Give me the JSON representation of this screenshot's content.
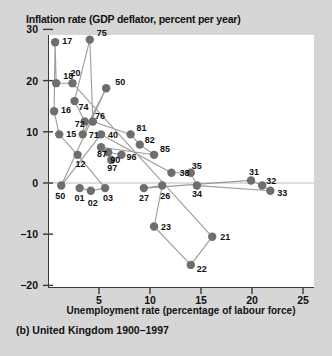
{
  "chart_data": {
    "type": "scatter",
    "title": "Inflation rate (GDP deflator, percent per year)",
    "caption": "(b) United Kingdom 1900–1997",
    "xlabel": "Unemployment rate (percentage of labour force)",
    "ylabel": "Inflation rate (GDP deflator, percent per year)",
    "xlim": [
      0,
      26
    ],
    "ylim": [
      -20,
      32
    ],
    "xticks": [
      5,
      10,
      15,
      20,
      25
    ],
    "yticks": [
      30,
      20,
      10,
      0,
      -10,
      -20
    ],
    "grid": false,
    "legend": null,
    "marker_color": "#6e6e6e",
    "line_color": "#8a8a8a",
    "zero_line": 0,
    "connected": true,
    "points": [
      {
        "label": "17",
        "x": 0.7,
        "y": 27.5
      },
      {
        "label": "18",
        "x": 0.8,
        "y": 19.5
      },
      {
        "label": "16",
        "x": 0.6,
        "y": 14.0
      },
      {
        "label": "15",
        "x": 1.1,
        "y": 9.5
      },
      {
        "label": "20",
        "x": 2.4,
        "y": 19.5
      },
      {
        "label": "74",
        "x": 2.6,
        "y": 16.0
      },
      {
        "label": "72",
        "x": 3.6,
        "y": 12.0
      },
      {
        "label": "76",
        "x": 4.4,
        "y": 12.0
      },
      {
        "label": "71",
        "x": 3.4,
        "y": 9.5
      },
      {
        "label": "75",
        "x": 4.1,
        "y": 28.0
      },
      {
        "label": "50",
        "x": 5.7,
        "y": 18.5
      },
      {
        "label": "40",
        "x": 5.2,
        "y": 9.5
      },
      {
        "label": "87",
        "x": 5.2,
        "y": 7.0
      },
      {
        "label": "90",
        "x": 5.9,
        "y": 6.0
      },
      {
        "label": "96",
        "x": 7.2,
        "y": 5.5
      },
      {
        "label": "97",
        "x": 6.2,
        "y": 4.5
      },
      {
        "label": "12",
        "x": 2.9,
        "y": 5.5
      },
      {
        "label": "81",
        "x": 8.1,
        "y": 9.5
      },
      {
        "label": "82",
        "x": 9.0,
        "y": 7.5
      },
      {
        "label": "85",
        "x": 10.4,
        "y": 5.5
      },
      {
        "label": "38",
        "x": 12.1,
        "y": 2.0
      },
      {
        "label": "35",
        "x": 14.0,
        "y": 2.0
      },
      {
        "label": "31",
        "x": 19.9,
        "y": 0.5
      },
      {
        "label": "32",
        "x": 21.0,
        "y": -0.5
      },
      {
        "label": "33",
        "x": 21.8,
        "y": -1.5
      },
      {
        "label": "34",
        "x": 14.6,
        "y": -0.5
      },
      {
        "label": "26",
        "x": 11.2,
        "y": -0.5
      },
      {
        "label": "27",
        "x": 9.4,
        "y": -1.0
      },
      {
        "label": "50b",
        "x": 1.3,
        "y": -0.5
      },
      {
        "label": "01",
        "x": 3.1,
        "y": -1.0
      },
      {
        "label": "02",
        "x": 4.2,
        "y": -1.5
      },
      {
        "label": "03",
        "x": 5.6,
        "y": -1.0
      },
      {
        "label": "23",
        "x": 10.4,
        "y": -8.5
      },
      {
        "label": "21",
        "x": 16.1,
        "y": -10.5
      },
      {
        "label": "22",
        "x": 14.0,
        "y": -16.0
      }
    ],
    "visible_point_labels": [
      "17",
      "20",
      "18",
      "16",
      "75",
      "74",
      "15",
      "72",
      "76",
      "50",
      "71",
      "40",
      "12",
      "87",
      "90",
      "96",
      "97",
      "81",
      "82",
      "85",
      "38",
      "35",
      "31",
      "32",
      "33",
      "34",
      "26",
      "27",
      "50",
      "01",
      "02",
      "03",
      "23",
      "21",
      "22"
    ]
  }
}
